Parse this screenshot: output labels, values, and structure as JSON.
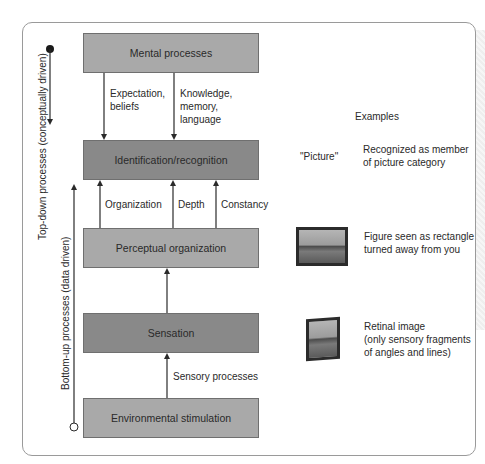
{
  "diagram": {
    "boxes": {
      "mental": "Mental processes",
      "identification": "Identification/recognition",
      "perceptual": "Perceptual organization",
      "sensation": "Sensation",
      "environmental": "Environmental stimulation"
    },
    "arrow_labels": {
      "expectation": "Expectation,\nbeliefs",
      "knowledge": "Knowledge,\nmemory,\nlanguage",
      "organization": "Organization",
      "depth": "Depth",
      "constancy": "Constancy",
      "sensory": "Sensory processes"
    },
    "side_axes": {
      "top_down": "Top-down processes (conceptually driven)",
      "bottom_up": "Bottom-up processes (data driven)"
    },
    "examples": {
      "heading": "Examples",
      "picture_word": "\"Picture\"",
      "recognized": "Recognized as member\nof picture category",
      "figure": "Figure seen as rectangle\nturned away from you",
      "retinal": "Retinal image\n(only sensory fragments\nof angles and lines)"
    },
    "colors": {
      "box_light": "#a9a9a9",
      "box_dark": "#898989",
      "line": "#2a2a2a",
      "card_border": "#9a9a9a"
    }
  }
}
